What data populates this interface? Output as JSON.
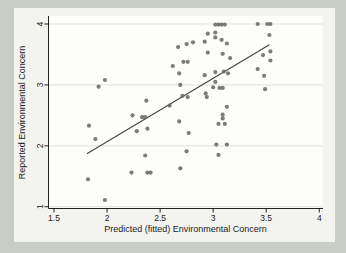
{
  "chart_data": {
    "type": "scatter",
    "title": "",
    "xlabel": "Predicted (fitted) Environmental Concern",
    "ylabel": "Reported Environmental Concern",
    "xlim": [
      1.5,
      4
    ],
    "ylim": [
      1,
      4
    ],
    "xticks": [
      1.5,
      2,
      2.5,
      3,
      3.5,
      4
    ],
    "yticks": [
      1,
      2,
      3,
      4
    ],
    "grid": "horizontal-y-only",
    "legend": "none",
    "marker_shape": "filled-circle",
    "points": [
      [
        1.82,
        1.45
      ],
      [
        1.83,
        2.33
      ],
      [
        1.89,
        2.11
      ],
      [
        1.92,
        2.97
      ],
      [
        1.98,
        3.08
      ],
      [
        1.98,
        1.11
      ],
      [
        2.23,
        1.56
      ],
      [
        2.24,
        2.5
      ],
      [
        2.28,
        2.24
      ],
      [
        2.33,
        2.47
      ],
      [
        2.36,
        2.47
      ],
      [
        2.36,
        1.84
      ],
      [
        2.37,
        2.74
      ],
      [
        2.38,
        2.28
      ],
      [
        2.38,
        1.56
      ],
      [
        2.41,
        1.56
      ],
      [
        2.59,
        2.66
      ],
      [
        2.62,
        3.31
      ],
      [
        2.67,
        3.62
      ],
      [
        2.68,
        3.19
      ],
      [
        2.68,
        2.4
      ],
      [
        2.69,
        3.0
      ],
      [
        2.69,
        1.63
      ],
      [
        2.71,
        2.82
      ],
      [
        2.72,
        3.38
      ],
      [
        2.75,
        3.67
      ],
      [
        2.75,
        1.91
      ],
      [
        2.76,
        3.38
      ],
      [
        2.76,
        2.8
      ],
      [
        2.77,
        2.21
      ],
      [
        2.81,
        3.7
      ],
      [
        2.92,
        3.71
      ],
      [
        2.92,
        3.16
      ],
      [
        2.93,
        2.86
      ],
      [
        2.94,
        2.8
      ],
      [
        2.95,
        3.84
      ],
      [
        2.95,
        3.53
      ],
      [
        3.0,
        2.96
      ],
      [
        3.02,
        3.99
      ],
      [
        3.02,
        3.86
      ],
      [
        3.02,
        3.78
      ],
      [
        3.02,
        3.21
      ],
      [
        3.02,
        3.05
      ],
      [
        3.03,
        2.02
      ],
      [
        3.05,
        3.99
      ],
      [
        3.05,
        2.36
      ],
      [
        3.05,
        1.85
      ],
      [
        3.06,
        2.95
      ],
      [
        3.08,
        3.99
      ],
      [
        3.08,
        3.74
      ],
      [
        3.09,
        3.51
      ],
      [
        3.09,
        2.95
      ],
      [
        3.09,
        2.51
      ],
      [
        3.09,
        2.45
      ],
      [
        3.1,
        3.22
      ],
      [
        3.11,
        3.99
      ],
      [
        3.11,
        2.36
      ],
      [
        3.13,
        3.68
      ],
      [
        3.13,
        2.64
      ],
      [
        3.13,
        2.02
      ],
      [
        3.14,
        3.19
      ],
      [
        3.16,
        3.44
      ],
      [
        3.42,
        4.0
      ],
      [
        3.42,
        3.26
      ],
      [
        3.47,
        3.49
      ],
      [
        3.48,
        3.15
      ],
      [
        3.49,
        2.93
      ],
      [
        3.51,
        4.0
      ],
      [
        3.53,
        3.82
      ],
      [
        3.54,
        4.0
      ],
      [
        3.54,
        3.55
      ],
      [
        3.54,
        3.4
      ]
    ],
    "fit_line": {
      "x1": 1.81,
      "y1": 1.87,
      "x2": 3.53,
      "y2": 3.66
    },
    "colors": {
      "margin_bg": "#caccc6",
      "figure_bg": "#f3f3ef",
      "plot_bg": "#fdfdfb",
      "gridline": "#dde4dc",
      "axis": "#222222",
      "text": "#1c1c1c",
      "marker": "#6a6a6a",
      "fit_line": "#444444"
    }
  }
}
